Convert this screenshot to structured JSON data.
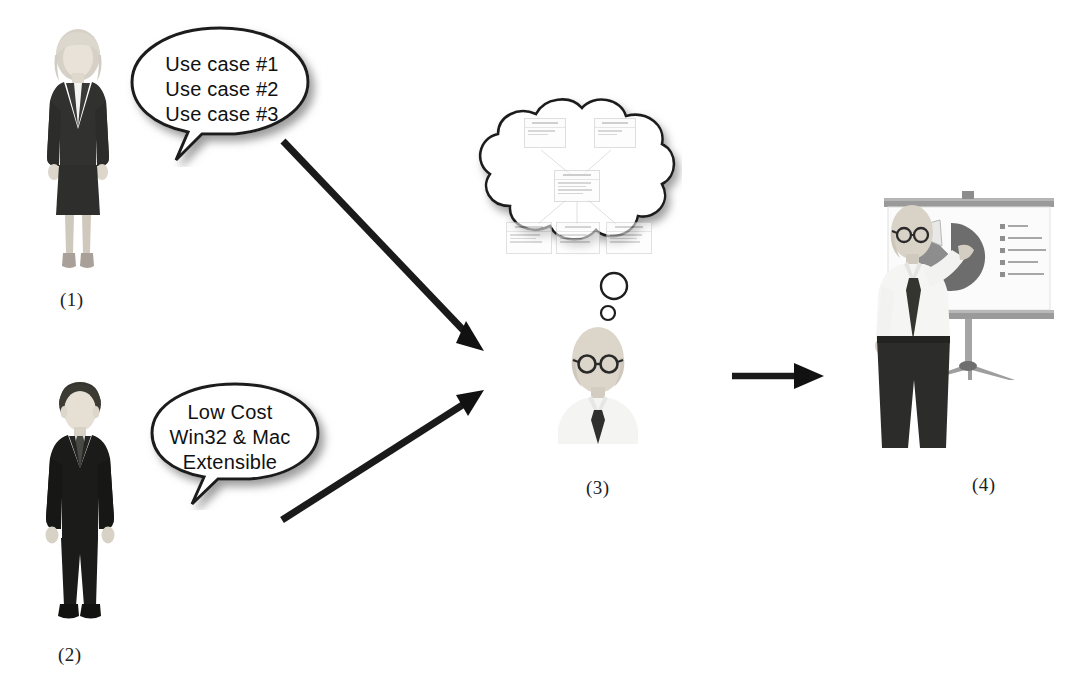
{
  "diagram": {
    "background_color": "#ffffff"
  },
  "steps": [
    {
      "id": "step-1",
      "caption": "(1)",
      "actor": "businesswoman-figure",
      "role": "requirements stakeholder"
    },
    {
      "id": "step-2",
      "caption": "(2)",
      "actor": "businessman-figure",
      "role": "constraints stakeholder"
    },
    {
      "id": "step-3",
      "caption": "(3)",
      "actor": "architect-figure",
      "role": "designer thinking of UML model"
    },
    {
      "id": "step-4",
      "caption": "(4)",
      "actor": "presenter-figure",
      "role": "presenter at projection screen"
    }
  ],
  "speech_bubbles": [
    {
      "id": "use-cases-bubble",
      "owner": "businesswoman-figure",
      "lines": [
        "Use case #1",
        "Use case #2",
        "Use case #3"
      ]
    },
    {
      "id": "constraints-bubble",
      "owner": "businessman-figure",
      "lines": [
        "Low Cost",
        "Win32 & Mac",
        "Extensible"
      ]
    }
  ],
  "thought_cloud": {
    "id": "uml-thought-cloud",
    "owner": "architect-figure",
    "content_type": "uml-class-diagram",
    "boxes_top": 2,
    "boxes_middle": 1,
    "boxes_bottom": 3,
    "legible": false
  },
  "presentation": {
    "id": "projection-screen",
    "chart_type": "pie",
    "legend_entry_count": 5,
    "exploded_slice": true,
    "legible": false
  },
  "arrows": [
    {
      "id": "arrow-stakeholder1-to-architect",
      "from": "step-1",
      "to": "step-3",
      "direction": "down-right"
    },
    {
      "id": "arrow-stakeholder2-to-architect",
      "from": "step-2",
      "to": "step-3",
      "direction": "up-right"
    },
    {
      "id": "arrow-architect-to-presenter",
      "from": "step-3",
      "to": "step-4",
      "direction": "right"
    }
  ],
  "colors": {
    "ink": "#1d1d1d",
    "arrow": "#1a1a1a",
    "outline": "#2a2a2a",
    "shadow": "#9a9a9a",
    "suit_dark": "#2b2b2b",
    "suit_black": "#151515",
    "skin": "#d6cfc6",
    "hair_light": "#d9d4cb",
    "hair_dark": "#3a3a3a",
    "shirt": "#f2f2f2",
    "chart_dark": "#6f6f6f",
    "chart_light": "#d8d8d8"
  }
}
